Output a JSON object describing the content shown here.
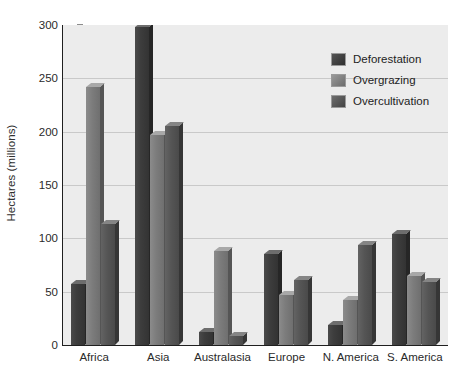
{
  "chart_data": {
    "type": "bar",
    "title": "",
    "xlabel": "",
    "ylabel": "Hectares (millions)",
    "ylim": [
      0,
      300
    ],
    "yticks": [
      0,
      50,
      100,
      150,
      200,
      250,
      300
    ],
    "ytick_labels": [
      "0",
      "50",
      "100",
      "150",
      "200",
      "250",
      "300"
    ],
    "grid": true,
    "legend_position": "upper-right-inside",
    "categories": [
      "Africa",
      "Asia",
      "Australasia",
      "Europe",
      "N. America",
      "S. America"
    ],
    "series": [
      {
        "name": "Deforestation",
        "color": "#3d3d3d",
        "values": [
          57,
          298,
          12,
          85,
          19,
          104
        ]
      },
      {
        "name": "Overgrazing",
        "color": "#7c7c7c",
        "values": [
          242,
          197,
          88,
          47,
          42,
          65
        ]
      },
      {
        "name": "Overcultivation",
        "color": "#555555",
        "values": [
          113,
          205,
          8,
          61,
          94,
          59
        ]
      }
    ]
  },
  "plot": {
    "background_color": "#ececec",
    "gridline_color": "#c9c9c9",
    "axis_color": "#1f1f1f"
  }
}
